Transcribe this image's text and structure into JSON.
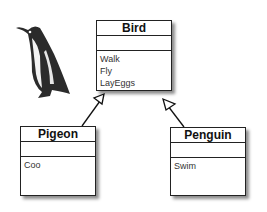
{
  "diagram": {
    "type": "UML class diagram",
    "classes": [
      {
        "name": "Bird",
        "attributes": [],
        "operations": [
          "Walk",
          "Fly",
          "LayEggs"
        ]
      },
      {
        "name": "Pigeon",
        "attributes": [],
        "operations": [
          "Coo"
        ]
      },
      {
        "name": "Penguin",
        "attributes": [],
        "operations": [
          "Swim"
        ]
      }
    ],
    "relations": [
      {
        "from": "Pigeon",
        "to": "Bird",
        "type": "inheritance"
      },
      {
        "from": "Penguin",
        "to": "Bird",
        "type": "inheritance"
      }
    ],
    "image": "penguin-photo"
  }
}
